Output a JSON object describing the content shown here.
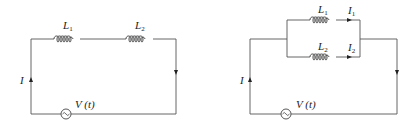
{
  "diagrams": [
    {
      "name": "series-circuit",
      "inductors": [
        {
          "label": "L",
          "subscript": "1"
        },
        {
          "label": "L",
          "subscript": "2"
        }
      ],
      "current_label": "I",
      "source_label": "V (t)"
    },
    {
      "name": "parallel-circuit",
      "inductors": [
        {
          "label": "L",
          "subscript": "1",
          "current_label": "I",
          "current_subscript": "1"
        },
        {
          "label": "L",
          "subscript": "2",
          "current_label": "I",
          "current_subscript": "2"
        }
      ],
      "current_label": "I",
      "source_label": "V (t)"
    }
  ],
  "colors": {
    "wire": "#555555",
    "text": "#222222",
    "background": "#ffffff"
  }
}
